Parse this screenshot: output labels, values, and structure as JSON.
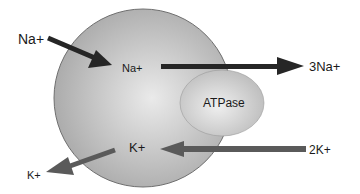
{
  "diagram": {
    "colors": {
      "cell_fill_center": "#e8e8e8",
      "cell_fill_edge": "#a9a9a9",
      "cell_stroke": "#6f6f6f",
      "atpase_fill_center": "#ececec",
      "atpase_fill_edge": "#bdbdbd",
      "arrow_dark": "#262626",
      "arrow_gray": "#5a5a5a",
      "text": "#1a1a1a"
    },
    "labels": {
      "na_outside": "Na+",
      "na_inside": "Na+",
      "na_out_3": "3Na+",
      "atpase": "ATPase",
      "k_inside": "K+",
      "k_in_2": "2K+",
      "k_outside": "K+"
    }
  }
}
